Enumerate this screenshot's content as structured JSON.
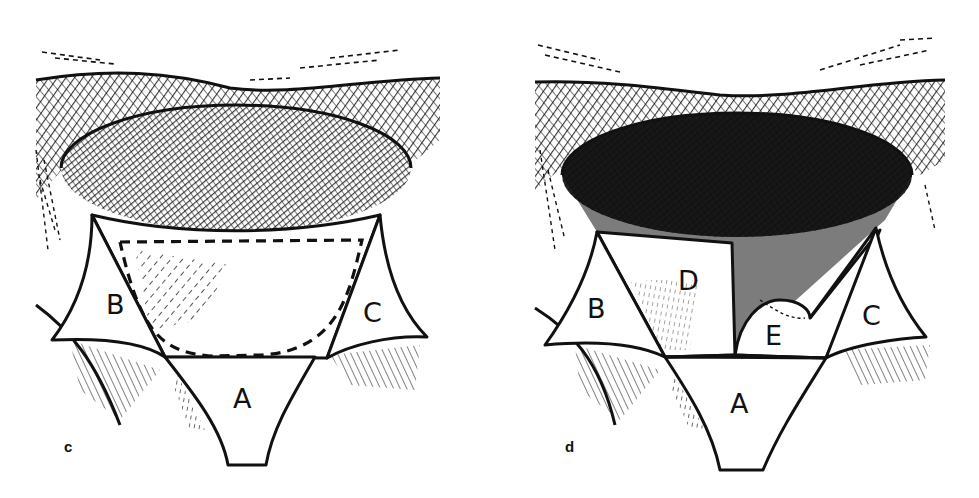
{
  "figure": {
    "panels": [
      {
        "id": "c",
        "panel_label": "c",
        "flaps": [
          {
            "key": "A",
            "label": "A"
          },
          {
            "key": "B",
            "label": "B"
          },
          {
            "key": "C",
            "label": "C"
          }
        ],
        "features": [
          "elliptical defect (hatched)",
          "dashed incision outline"
        ]
      },
      {
        "id": "d",
        "panel_label": "d",
        "flaps": [
          {
            "key": "A",
            "label": "A"
          },
          {
            "key": "B",
            "label": "B"
          },
          {
            "key": "C",
            "label": "C"
          },
          {
            "key": "D",
            "label": "D"
          },
          {
            "key": "E",
            "label": "E"
          }
        ],
        "features": [
          "elliptical defect (dense cross-hatched)",
          "rectangular flap D",
          "curved flap E"
        ]
      }
    ]
  },
  "colors": {
    "ink": "#111111",
    "paper": "#ffffff"
  }
}
